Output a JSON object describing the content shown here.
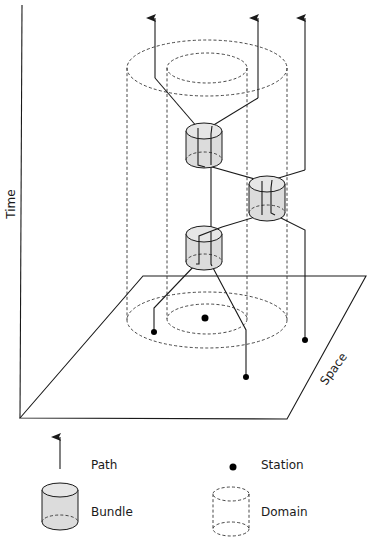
{
  "diagram": {
    "axes": {
      "time_label": "Time",
      "space_label": "Space"
    },
    "legend": {
      "path_label": "Path",
      "station_label": "Station",
      "bundle_label": "Bundle",
      "domain_label": "Domain"
    },
    "colors": {
      "line": "#1a1a1a",
      "bundle_fill": "#dcdcdc",
      "station": "#000000",
      "background": "#ffffff"
    }
  }
}
